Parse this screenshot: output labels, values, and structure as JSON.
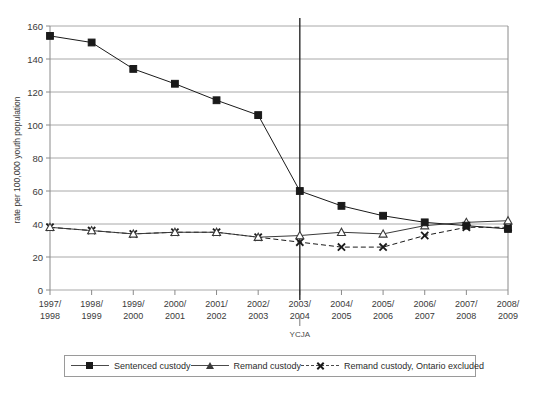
{
  "chart_data": {
    "type": "line",
    "title": "",
    "xlabel": "",
    "ylabel": "rate per 100,000 youth population",
    "ylim": [
      0,
      160
    ],
    "ytick_step": 20,
    "yticks": [
      0,
      20,
      40,
      60,
      80,
      100,
      120,
      140,
      160
    ],
    "grid": true,
    "legend_position": "bottom",
    "categories": [
      "1997/\n1998",
      "1998/\n1999",
      "1999/\n2000",
      "2000/\n2001",
      "2001/\n2002",
      "2002/\n2003",
      "2003/\n2004",
      "2004/\n2005",
      "2005/\n2006",
      "2006/\n2007",
      "2007/\n2008",
      "2008/\n2009"
    ],
    "categories_line1": [
      "1997/",
      "1998/",
      "1999/",
      "2000/",
      "2001/",
      "2002/",
      "2003/",
      "2004/",
      "2005/",
      "2006/",
      "2007/",
      "2008/"
    ],
    "categories_line2": [
      "1998",
      "1999",
      "2000",
      "2001",
      "2002",
      "2003",
      "2004",
      "2005",
      "2006",
      "2007",
      "2008",
      "2009"
    ],
    "series": [
      {
        "name": "Sentenced custody",
        "marker": "filled-square",
        "line": "solid",
        "color": "#1a1a1a",
        "values": [
          154,
          150,
          134,
          125,
          115,
          106,
          60,
          51,
          45,
          41,
          39,
          37
        ]
      },
      {
        "name": "Remand custody",
        "marker": "open-triangle",
        "line": "solid",
        "color": "#3a3a3a",
        "values": [
          38,
          36,
          34,
          35,
          35,
          32,
          33,
          35,
          34,
          39,
          41,
          42
        ]
      },
      {
        "name": "Remand custody, Ontario excluded",
        "marker": "x",
        "line": "dashed",
        "color": "#1a1a1a",
        "values": [
          38,
          36,
          34,
          35,
          35,
          32,
          29,
          26,
          26,
          33,
          38,
          38
        ]
      }
    ],
    "annotations": [
      {
        "label": "YCJA",
        "at_category": "2003/2004",
        "type": "vertical-line"
      }
    ]
  },
  "legend": {
    "entries": [
      {
        "label": "Sentenced custody",
        "marker": "filled-square",
        "line": "solid"
      },
      {
        "label": "Remand custody",
        "marker": "open-triangle",
        "line": "solid"
      },
      {
        "label": "Remand custody, Ontario excluded",
        "marker": "x",
        "line": "dashed"
      }
    ]
  }
}
